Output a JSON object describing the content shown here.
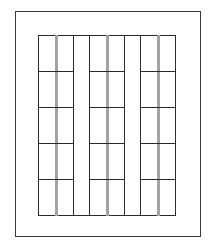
{
  "diagram": {
    "type": "window-grid-elevation",
    "frame": {
      "left": 15,
      "top": 11,
      "width": 186,
      "height": 226,
      "stroke": "#3a3a3a"
    },
    "grid": {
      "left": 38,
      "top": 35,
      "width": 138,
      "height": 181,
      "stroke": "#2a2a2a"
    },
    "rows": 5,
    "row_lines_y": [
      71,
      107,
      143,
      179
    ],
    "column_groups": [
      {
        "left": 38,
        "width": 36,
        "mullion_x": 55
      },
      {
        "left": 89,
        "width": 36,
        "mullion_x": 106
      },
      {
        "left": 140,
        "width": 36,
        "mullion_x": 157
      }
    ],
    "mullion_color": "#a3a3a3",
    "mullion_width": 3
  }
}
